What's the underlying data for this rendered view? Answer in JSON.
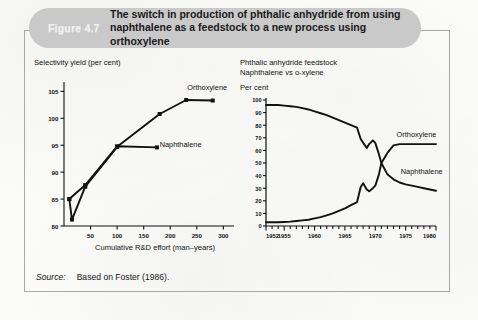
{
  "figure": {
    "badge": "Figure 4.7",
    "title_line1": "The switch in production of phthalic anhydride from using",
    "title_line2": "naphthalene as a feedstock to a new process using orthoxylene",
    "banner_color": "#c9c9c9",
    "border_color": "#a9a9a9"
  },
  "source": {
    "label": "Source:",
    "text": "Based on Foster (1986)."
  },
  "chart_data": [
    {
      "id": "selectivity-yield",
      "type": "line",
      "title": "Selectivity yield (per cent)",
      "xlabel": "Cumulative R&D effort (man–years)",
      "ylabel": "",
      "xlim": [
        0,
        320
      ],
      "ylim": [
        80,
        106
      ],
      "xticks": [
        50,
        100,
        150,
        200,
        250,
        300
      ],
      "yticks": [
        80,
        85,
        90,
        95,
        100,
        105
      ],
      "xtick_labels": [
        "50",
        "100",
        "150",
        "200",
        "250",
        "300"
      ],
      "ytick_labels": [
        "80",
        "85",
        "90",
        "95",
        "100",
        "105"
      ],
      "grid": false,
      "legend": "inline-annotations",
      "series": [
        {
          "name": "Naphthalene",
          "label_x": 180,
          "label_y": 95,
          "marker": "square",
          "x": [
            10,
            40,
            100,
            175
          ],
          "y": [
            85.0,
            87.6,
            94.8,
            94.6
          ]
        },
        {
          "name": "Orthoxylene",
          "label_x": 232,
          "label_y": 105.6,
          "marker": "square",
          "x": [
            10,
            15,
            40,
            100,
            180,
            230,
            280
          ],
          "y": [
            85.0,
            81.2,
            87.3,
            94.7,
            100.8,
            103.4,
            103.3
          ]
        }
      ]
    },
    {
      "id": "feedstock-share",
      "type": "line",
      "title_line1": "Phthalic anhydride feedstock",
      "title_line2": "Naphthalene vs o-xylene",
      "ylabel": "Per cent",
      "xlabel": "",
      "xlim": [
        1952,
        1980
      ],
      "ylim": [
        0,
        100
      ],
      "xticks": [
        1952,
        1955,
        1960,
        1965,
        1970,
        1975,
        1980
      ],
      "xtick_labels": [
        "1952",
        "1955",
        "1960",
        "1965",
        "1970",
        "1975",
        "1980"
      ],
      "yticks": [
        0,
        10,
        20,
        30,
        40,
        50,
        60,
        70,
        80,
        90,
        100
      ],
      "ytick_labels": [
        "0",
        "10",
        "20",
        "30",
        "40",
        "50",
        "60",
        "70",
        "80",
        "90",
        "100"
      ],
      "minor_xticks_every": 1,
      "grid": false,
      "legend": "inline-annotations",
      "series": [
        {
          "name": "Naphthalene",
          "label_x": 1974.2,
          "label_y": 43,
          "x": [
            1952,
            1953,
            1954,
            1955,
            1956,
            1957,
            1958,
            1959,
            1960,
            1961,
            1962,
            1963,
            1964,
            1965,
            1966,
            1967,
            1967.6,
            1968,
            1968.6,
            1969,
            1969.6,
            1970,
            1970.6,
            1971,
            1972,
            1973,
            1974,
            1975,
            1976,
            1977,
            1978,
            1979,
            1980
          ],
          "y": [
            96,
            96,
            96,
            95.5,
            95,
            94.5,
            93.5,
            92.5,
            91,
            89.5,
            88,
            86,
            84,
            82,
            80,
            78,
            69,
            66,
            62,
            65,
            68,
            66,
            57,
            50,
            41,
            37,
            34.5,
            33,
            32,
            31,
            30,
            29,
            28
          ]
        },
        {
          "name": "Orthoxylene",
          "label_x": 1973.5,
          "label_y": 72,
          "x": [
            1952,
            1953,
            1954,
            1955,
            1956,
            1957,
            1958,
            1959,
            1960,
            1961,
            1962,
            1963,
            1964,
            1965,
            1966,
            1967,
            1967.6,
            1968,
            1968.6,
            1969,
            1969.6,
            1970,
            1970.6,
            1971,
            1972,
            1973,
            1974,
            1975,
            1976,
            1977,
            1978,
            1979,
            1980
          ],
          "y": [
            3,
            3,
            3,
            3.2,
            3.5,
            4,
            4.5,
            5,
            6,
            7,
            8.5,
            10,
            12,
            14,
            16.5,
            19,
            31,
            34,
            29,
            27.5,
            30,
            32,
            41,
            50,
            58,
            64,
            65,
            65,
            65,
            65,
            65,
            65,
            65
          ]
        }
      ]
    }
  ]
}
